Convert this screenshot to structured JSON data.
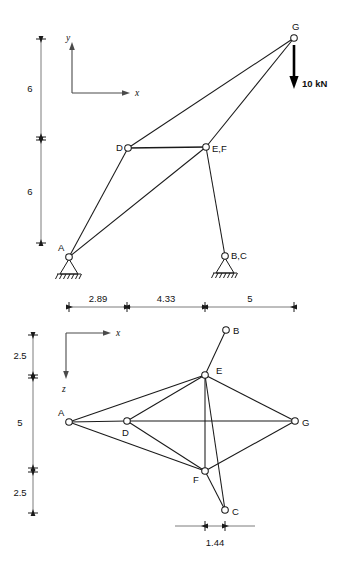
{
  "figure": {
    "type": "space-truss-two-view-diagram",
    "views": [
      {
        "id": "elevation",
        "name": "elevation-view",
        "axes": {
          "horizontal": "x",
          "vertical": "y"
        },
        "nodes": [
          {
            "id": "A",
            "label": "A",
            "px": 69,
            "py": 257,
            "label_dx": -11,
            "label_dy": -6,
            "support": "pin"
          },
          {
            "id": "D",
            "label": "D",
            "px": 128,
            "py": 148,
            "label_dx": -12,
            "label_dy": 3
          },
          {
            "id": "EF",
            "label": "E,F",
            "px": 206,
            "py": 147,
            "label_dx": 6,
            "label_dy": 5
          },
          {
            "id": "BC",
            "label": "B,C",
            "px": 225,
            "py": 256,
            "label_dx": 6,
            "label_dy": 3,
            "support": "pin"
          },
          {
            "id": "G",
            "label": "G",
            "px": 294,
            "py": 38,
            "label_dx": -2,
            "label_dy": -8
          }
        ],
        "members": [
          {
            "from": "A",
            "to": "D"
          },
          {
            "from": "A",
            "to": "EF"
          },
          {
            "from": "D",
            "to": "EF",
            "emphasis": "thick"
          },
          {
            "from": "D",
            "to": "G"
          },
          {
            "from": "EF",
            "to": "G"
          },
          {
            "from": "EF",
            "to": "BC"
          }
        ],
        "load": {
          "label": "10 kN",
          "at_node": "G",
          "direction": "down",
          "magnitude": 10,
          "unit": "kN"
        },
        "vertical_dimensions": [
          {
            "value": "6",
            "from_py": 39,
            "to_py": 137
          },
          {
            "value": "6",
            "from_py": 140,
            "to_py": 243
          }
        ],
        "horizontal_dimensions": [
          {
            "value": "2.89",
            "from_px": 69,
            "to_px": 127
          },
          {
            "value": "4.33",
            "from_px": 127,
            "to_px": 205
          },
          {
            "value": "5",
            "from_px": 205,
            "to_px": 294
          }
        ]
      },
      {
        "id": "plan",
        "name": "plan-view",
        "axes": {
          "horizontal": "x",
          "vertical": "z"
        },
        "nodes": [
          {
            "id": "A",
            "label": "A",
            "px": 69,
            "py": 422,
            "label_dx": -12,
            "label_dy": -7
          },
          {
            "id": "D",
            "label": "D",
            "px": 127,
            "py": 421,
            "label_dx": -3,
            "label_dy": 13
          },
          {
            "id": "B",
            "label": "B",
            "px": 226,
            "py": 330,
            "label_dx": 6,
            "label_dy": 3
          },
          {
            "id": "E",
            "label": "E",
            "px": 205,
            "py": 375,
            "label_dx": 10,
            "label_dy": -2
          },
          {
            "id": "F",
            "label": "F",
            "px": 205,
            "py": 471,
            "label_dx": -12,
            "label_dy": 9
          },
          {
            "id": "C",
            "label": "C",
            "px": 225,
            "py": 510,
            "label_dx": 7,
            "label_dy": 4
          },
          {
            "id": "G",
            "label": "G",
            "px": 295,
            "py": 421,
            "label_dx": 7,
            "label_dy": 4
          }
        ],
        "members": [
          {
            "from": "A",
            "to": "E"
          },
          {
            "from": "A",
            "to": "D"
          },
          {
            "from": "A",
            "to": "F"
          },
          {
            "from": "D",
            "to": "E"
          },
          {
            "from": "D",
            "to": "G"
          },
          {
            "from": "D",
            "to": "F"
          },
          {
            "from": "E",
            "to": "B"
          },
          {
            "from": "E",
            "to": "F"
          },
          {
            "from": "E",
            "to": "C"
          },
          {
            "from": "E",
            "to": "G"
          },
          {
            "from": "F",
            "to": "C"
          },
          {
            "from": "F",
            "to": "G"
          }
        ],
        "vertical_dimensions": [
          {
            "value": "2.5",
            "from_py": 335,
            "to_py": 375
          },
          {
            "value": "5",
            "from_py": 378,
            "to_py": 468
          },
          {
            "value": "2.5",
            "from_py": 472,
            "to_py": 513
          }
        ],
        "horizontal_dimensions": [
          {
            "value": "1.44",
            "from_px": 205,
            "to_px": 225
          }
        ]
      }
    ]
  }
}
